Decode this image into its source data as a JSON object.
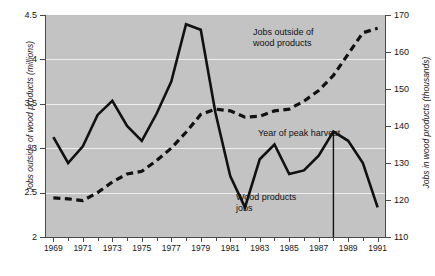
{
  "chart_data": {
    "type": "line",
    "title": "",
    "xlabel": "",
    "x": [
      1969,
      1970,
      1971,
      1972,
      1973,
      1974,
      1975,
      1976,
      1977,
      1978,
      1979,
      1980,
      1981,
      1982,
      1983,
      1984,
      1985,
      1986,
      1987,
      1988,
      1989,
      1990,
      1991
    ],
    "xlim": [
      1968.5,
      1991.5
    ],
    "grid": true,
    "legend_position": "inline-annotations",
    "axes": [
      {
        "id": "left",
        "label": "Jobs outside of wood products (millions)",
        "ticks": [
          "2",
          "2.5",
          "3",
          "3.5",
          "4",
          "4.5"
        ],
        "tick_values": [
          2,
          2.5,
          3,
          3.5,
          4,
          4.5
        ],
        "ylim": [
          2,
          4.5
        ],
        "units": "millions"
      },
      {
        "id": "right",
        "label": "Jobs in wood products (thousands)",
        "ticks": [
          "110",
          "120",
          "130",
          "140",
          "150",
          "160",
          "170"
        ],
        "tick_values": [
          110,
          120,
          130,
          140,
          150,
          160,
          170
        ],
        "ylim": [
          110,
          170
        ],
        "units": "thousands"
      }
    ],
    "xticks_major": [
      "1969",
      "1971",
      "1973",
      "1975",
      "1977",
      "1979",
      "1981",
      "1983",
      "1985",
      "1987",
      "1989",
      "1991"
    ],
    "xticks_major_values": [
      1969,
      1971,
      1973,
      1975,
      1977,
      1979,
      1981,
      1983,
      1985,
      1987,
      1989,
      1991
    ],
    "xticks_minor_values": [
      1970,
      1972,
      1974,
      1976,
      1978,
      1980,
      1982,
      1984,
      1986,
      1988,
      1990
    ],
    "series": [
      {
        "name": "Jobs in wood products",
        "axis": "right",
        "style": "solid",
        "color": "#111111",
        "annotation": "Wood products\njobs",
        "values": [
          137.0,
          130.0,
          134.5,
          143.0,
          146.8,
          140.0,
          136.0,
          143.3,
          152.0,
          167.5,
          166.0,
          143.5,
          126.5,
          118.0,
          131.0,
          135.0,
          127.0,
          128.0,
          132.0,
          138.5,
          136.0,
          130.0,
          118.0
        ]
      },
      {
        "name": "Jobs outside of wood products",
        "axis": "left",
        "style": "dashed",
        "color": "#111111",
        "annotation": "Jobs outside of\nwood products",
        "values": [
          2.44,
          2.43,
          2.41,
          2.5,
          2.62,
          2.71,
          2.74,
          2.86,
          3.0,
          3.18,
          3.38,
          3.44,
          3.42,
          3.35,
          3.36,
          3.42,
          3.44,
          3.53,
          3.65,
          3.82,
          4.06,
          4.3,
          4.35
        ]
      }
    ],
    "annotations": [
      {
        "name": "year-of-peak-harvest",
        "text": "Year of peak harvest",
        "marker": "vertical-line",
        "x_value": 1988
      }
    ]
  },
  "y_left": {
    "title": "Jobs outside of wood products (millions)",
    "ticks": [
      "2",
      "2.5",
      "3",
      "3.5",
      "4",
      "4.5"
    ]
  },
  "y_right": {
    "title": "Jobs in wood products (thousands)",
    "ticks": [
      "110",
      "120",
      "130",
      "140",
      "150",
      "160",
      "170"
    ]
  },
  "annotations": {
    "outside": "Jobs outside of\nwood products",
    "wood": "Wood products\njobs",
    "peak": "Year of peak harvest"
  }
}
